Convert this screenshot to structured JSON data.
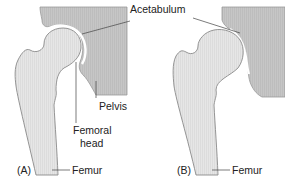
{
  "figure": {
    "panels": [
      {
        "id": "A",
        "label": "(A)",
        "description": "Normal hip joint: femoral head seated in acetabulum of pelvis",
        "annotations": {
          "acetabulum": "Acetabulum",
          "pelvis": "Pelvis",
          "femoral_head_line1": "Femoral",
          "femoral_head_line2": "head",
          "femur": "Femur"
        }
      },
      {
        "id": "B",
        "label": "(B)",
        "description": "Hip joint with shallow acetabulum: femoral head partially uncovered",
        "annotations": {
          "femur": "Femur"
        }
      }
    ],
    "colors": {
      "pelvis_fill": "#c8c8c8",
      "bone_fill": "#e4e4e4",
      "outline": "#8a8a8a",
      "leader_line": "#444444",
      "text": "#222222"
    }
  }
}
